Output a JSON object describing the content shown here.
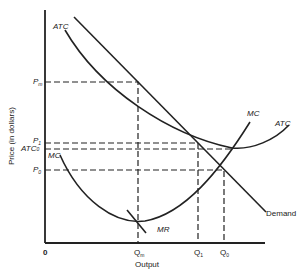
{
  "diagram": {
    "type": "economics-cost-curves",
    "axes": {
      "y_title": "Price (in dollars)",
      "x_title": "Output",
      "origin_label": "0"
    },
    "curves": [
      {
        "name": "ATC",
        "label": "ATC",
        "note": "upper-left label of ATC curve"
      },
      {
        "name": "ATC",
        "label": "ATC",
        "note": "right label of ATC curve"
      },
      {
        "name": "MC",
        "label": "MC",
        "note": "left label of MC curve"
      },
      {
        "name": "MC",
        "label": "MC",
        "note": "right label of MC curve"
      },
      {
        "name": "MR",
        "label": "MR"
      },
      {
        "name": "Demand",
        "label": "Demand"
      }
    ],
    "y_ticks": [
      {
        "label": "Pm",
        "main": "P",
        "sub": "m"
      },
      {
        "label": "P1",
        "main": "P",
        "sub": "1"
      },
      {
        "label": "ATC0",
        "main": "ATC",
        "sub": "0"
      },
      {
        "label": "P0",
        "main": "P",
        "sub": "0"
      }
    ],
    "x_ticks": [
      {
        "label": "Qm",
        "main": "Q",
        "sub": "m"
      },
      {
        "label": "Q1",
        "main": "Q",
        "sub": "1"
      },
      {
        "label": "Q0",
        "main": "Q",
        "sub": "0"
      }
    ]
  }
}
